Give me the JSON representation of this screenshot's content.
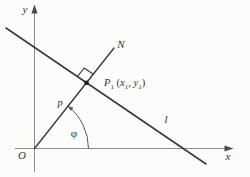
{
  "figure": {
    "labels": {
      "y_axis": "y",
      "x_axis": "x",
      "origin": "O",
      "normal_line": "N",
      "line_l": "l",
      "distance_p": "p",
      "angle_phi": "φ",
      "point": {
        "base": "P",
        "base_sub": "1",
        "open": " (",
        "coord_x": "x",
        "coord_x_sub": "1",
        "separator": ", ",
        "coord_y": "y",
        "coord_y_sub": "1",
        "close": ")"
      }
    },
    "colors": {
      "axis": "#8f8f8f",
      "line": "#3a3a3a",
      "text": "#333333",
      "background": "#fcfcfa"
    },
    "paths": {
      "x_axis": "M 15 148.5 H 230",
      "x_arrow": "233.5,148.5 224.5,145.4 224.5,151.6",
      "y_axis": "M 34.5 172 V 9",
      "y_arrow": "34.5,4.5 31.4,13.5 37.6,13.5",
      "line_l": "M 6 28 L 206 164",
      "line_n": "M 34.5 148.5 L 114 48",
      "right_angle": "M 77.4 76.6 L 84.2 68 L 93.3 74.2",
      "angle_arc": "M 88.5 148.5 A 54 54 0 0 0 67.4 105.7",
      "arc_arrow": "67.4,105.7 70.9,111.1 73.5,107.7"
    }
  }
}
